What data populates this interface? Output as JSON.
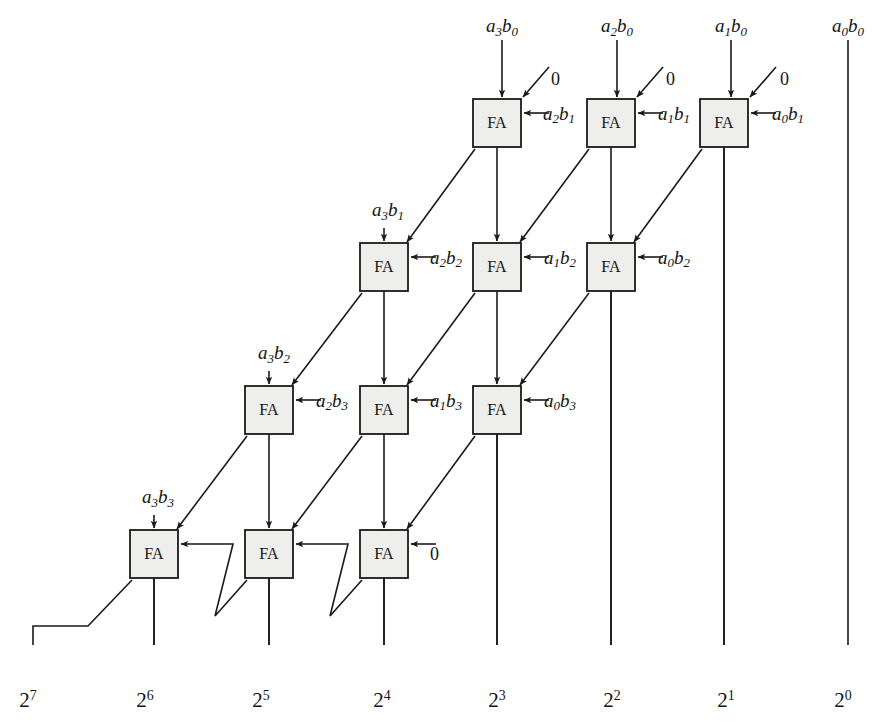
{
  "figure": {
    "cell_label": "FA",
    "grid": {
      "box_w": 48,
      "box_h": 48,
      "col_spacing": 114.5,
      "row_spacing": 143.5,
      "row0_box_y": 99,
      "row0_first_box_x": 473
    }
  },
  "top_inputs": [
    {
      "name": "a3b0",
      "a": "a",
      "ai": "3",
      "b": "b",
      "bi": "0",
      "x": 502,
      "label_x": 502,
      "label_y": 16,
      "has_wire": true
    },
    {
      "name": "a2b0",
      "a": "a",
      "ai": "2",
      "b": "b",
      "bi": "0",
      "x": 617,
      "label_x": 617,
      "label_y": 16,
      "has_wire": true
    },
    {
      "name": "a1b0",
      "a": "a",
      "ai": "1",
      "b": "b",
      "bi": "0",
      "x": 731,
      "label_x": 731,
      "label_y": 16,
      "has_wire": true
    },
    {
      "name": "a0b0",
      "a": "a",
      "ai": "0",
      "b": "b",
      "bi": "0",
      "x": 848,
      "label_x": 848,
      "label_y": 16,
      "has_wire": true
    }
  ],
  "zero_inputs": [
    {
      "name": "zero-row0-col0",
      "text": "0",
      "x": 551,
      "y": 70
    },
    {
      "name": "zero-row0-col1",
      "text": "0",
      "x": 666,
      "y": 70
    },
    {
      "name": "zero-row0-col2",
      "text": "0",
      "x": 780,
      "y": 70
    },
    {
      "name": "zero-row3-carryin",
      "text": "0",
      "x": 430,
      "y": 545
    }
  ],
  "rows": [
    {
      "name": "row-0",
      "index": 0,
      "box_y": 99,
      "left_input": null,
      "side_inputs": [
        {
          "name": "a2b1",
          "a": "a",
          "ai": "2",
          "b": "b",
          "bi": "1",
          "x": 543,
          "y": 113
        },
        {
          "name": "a1b1",
          "a": "a",
          "ai": "1",
          "b": "b",
          "bi": "1",
          "x": 658,
          "y": 113
        },
        {
          "name": "a0b1",
          "a": "a",
          "ai": "0",
          "b": "b",
          "bi": "1",
          "x": 772,
          "y": 113
        }
      ],
      "cells": [
        {
          "name": "fa-r0-c0",
          "x": 473
        },
        {
          "name": "fa-r0-c1",
          "x": 587
        },
        {
          "name": "fa-r0-c2",
          "x": 700
        }
      ]
    },
    {
      "name": "row-1",
      "index": 1,
      "box_y": 243,
      "left_input": {
        "name": "a3b1",
        "a": "a",
        "ai": "3",
        "b": "b",
        "bi": "1",
        "x": 388,
        "y": 200
      },
      "side_inputs": [
        {
          "name": "a2b2",
          "a": "a",
          "ai": "2",
          "b": "b",
          "bi": "2",
          "x": 430,
          "y": 257
        },
        {
          "name": "a1b2",
          "a": "a",
          "ai": "1",
          "b": "b",
          "bi": "2",
          "x": 544,
          "y": 257
        },
        {
          "name": "a0b2",
          "a": "a",
          "ai": "0",
          "b": "b",
          "bi": "2",
          "x": 658,
          "y": 257
        }
      ],
      "cells": [
        {
          "name": "fa-r1-c0",
          "x": 360
        },
        {
          "name": "fa-r1-c1",
          "x": 473
        },
        {
          "name": "fa-r1-c2",
          "x": 587
        }
      ]
    },
    {
      "name": "row-2",
      "index": 2,
      "box_y": 386,
      "left_input": {
        "name": "a3b2",
        "a": "a",
        "ai": "3",
        "b": "b",
        "bi": "2",
        "x": 274,
        "y": 343
      },
      "side_inputs": [
        {
          "name": "a2b3",
          "a": "a",
          "ai": "2",
          "b": "b",
          "bi": "3",
          "x": 316,
          "y": 400
        },
        {
          "name": "a1b3",
          "a": "a",
          "ai": "1",
          "b": "b",
          "bi": "3",
          "x": 430,
          "y": 400
        },
        {
          "name": "a0b3",
          "a": "a",
          "ai": "0",
          "b": "b",
          "bi": "3",
          "x": 544,
          "y": 400
        }
      ],
      "cells": [
        {
          "name": "fa-r2-c0",
          "x": 245
        },
        {
          "name": "fa-r2-c1",
          "x": 360
        },
        {
          "name": "fa-r2-c2",
          "x": 473
        }
      ]
    },
    {
      "name": "row-3",
      "index": 3,
      "box_y": 530,
      "left_input": {
        "name": "a3b3",
        "a": "a",
        "ai": "3",
        "b": "b",
        "bi": "3",
        "x": 158,
        "y": 487
      },
      "side_inputs": [],
      "cells": [
        {
          "name": "fa-r3-c0",
          "x": 130
        },
        {
          "name": "fa-r3-c1",
          "x": 245
        },
        {
          "name": "fa-r3-c2",
          "x": 360
        }
      ]
    }
  ],
  "outputs": [
    {
      "name": "output-2-7",
      "base": "2",
      "exp": "7",
      "x": 28,
      "y": 690,
      "line_x": 33
    },
    {
      "name": "output-2-6",
      "base": "2",
      "exp": "6",
      "x": 145,
      "y": 690,
      "line_x": 150
    },
    {
      "name": "output-2-5",
      "base": "2",
      "exp": "5",
      "x": 261,
      "y": 690,
      "line_x": 266
    },
    {
      "name": "output-2-4",
      "base": "2",
      "exp": "4",
      "x": 382,
      "y": 690,
      "line_x": 387
    },
    {
      "name": "output-2-3",
      "base": "2",
      "exp": "3",
      "x": 497,
      "y": 690,
      "line_x": 502
    },
    {
      "name": "output-2-2",
      "base": "2",
      "exp": "2",
      "x": 612,
      "y": 690,
      "line_x": 617
    },
    {
      "name": "output-2-1",
      "base": "2",
      "exp": "1",
      "x": 726,
      "y": 690,
      "line_x": 731
    },
    {
      "name": "output-2-0",
      "base": "2",
      "exp": "0",
      "x": 843,
      "y": 690,
      "line_x": 848
    }
  ],
  "colors": {
    "wire": "#1a1a1a",
    "box_fill": "#eeeeec",
    "box_stroke": "#1a1a1a",
    "text": "#141414",
    "background": "#ffffff"
  }
}
